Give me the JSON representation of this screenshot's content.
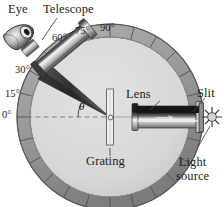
{
  "figure": {
    "kind": "physics-diagram",
    "background": "#ffffff"
  },
  "colors": {
    "ring_fill": "#9a9a9a",
    "ring_edge": "#5e5e5e",
    "disc_fill": "#d9d9d9",
    "disc_edge": "#8d8d8d",
    "tube_light": "#e8e8e8",
    "tube_mid": "#9c9c9c",
    "tube_dark": "#2a2a2a",
    "beam_dark": "#3a3a3a",
    "text": "#1b1b1b",
    "leader": "#4a4a4a",
    "axis_dash": "#7d7d7d"
  },
  "labels": {
    "eye": "Eye",
    "telescope": "Telescope",
    "lens": "Lens",
    "slit": "Slit",
    "grating": "Grating",
    "light_source_line1": "Light",
    "light_source_line2": "source",
    "theta": "θ"
  },
  "angle_scale": {
    "unit": "°",
    "ticks": [
      {
        "value": "0",
        "label": "0°"
      },
      {
        "value": "15",
        "label": "15°"
      },
      {
        "value": "30",
        "label": "30°"
      },
      {
        "value": "60",
        "label": "60°"
      },
      {
        "value": "75",
        "label": "75°"
      },
      {
        "value": "90",
        "label": "90°"
      }
    ]
  },
  "components": [
    {
      "name": "eye",
      "label": "Eye"
    },
    {
      "name": "telescope",
      "label": "Telescope"
    },
    {
      "name": "grating",
      "label": "Grating"
    },
    {
      "name": "lens",
      "label": "Lens"
    },
    {
      "name": "slit",
      "label": "Slit"
    },
    {
      "name": "light-source",
      "label": "Light source"
    },
    {
      "name": "angle-scale",
      "label": "Angular scale"
    }
  ]
}
